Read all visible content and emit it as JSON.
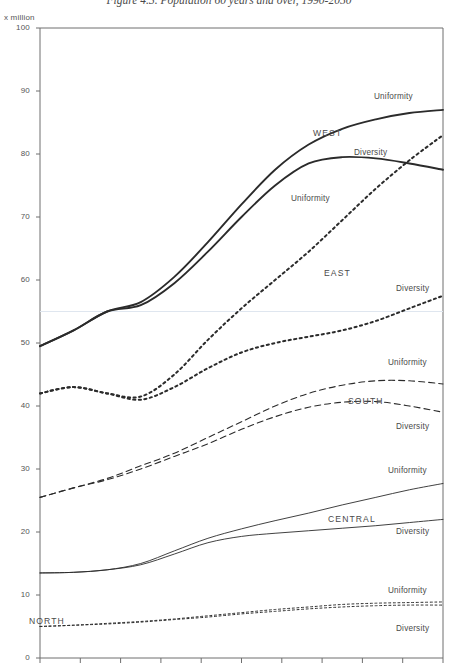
{
  "figure": {
    "title": "Figure 4.3.  Population 60 years and over, 1990-2050",
    "unit_label": "x million"
  },
  "axis": {
    "y_ticks": [
      "100",
      "90",
      "80",
      "70",
      "60",
      "50",
      "40",
      "30",
      "20",
      "10",
      "0"
    ],
    "y_min": 0,
    "y_max": 100,
    "x_min": 1990,
    "x_max": 2050,
    "x_tick_years": [
      1990,
      1996,
      2002,
      2008,
      2014,
      2020,
      2026,
      2032,
      2038,
      2044,
      2050
    ],
    "highlight_gridline_value": 55
  },
  "labels": {
    "region_west": "WEST",
    "region_east": "EAST",
    "region_south": "SOUTH",
    "region_central": "CENTRAL",
    "region_north": "NORTH",
    "west_uniformity": "Uniformity",
    "west_diversity": "Diversity",
    "east_uniformity": "Uniformity",
    "east_diversity": "Diversity",
    "south_uniformity": "Uniformity",
    "south_diversity": "Diversity",
    "central_uniformity": "Uniformity",
    "central_diversity": "Diversity",
    "north_uniformity": "Uniformity",
    "north_diversity": "Diversity"
  },
  "chart_data": {
    "type": "line",
    "title": "Figure 4.3.  Population 60 years and over, 1990-2050",
    "xlabel": "",
    "ylabel": "x million",
    "xlim": [
      1990,
      2050
    ],
    "ylim": [
      0,
      100
    ],
    "grid": false,
    "legend": "inline-annotations",
    "x": [
      1990,
      1995,
      2000,
      2005,
      2010,
      2015,
      2020,
      2025,
      2030,
      2035,
      2040,
      2045,
      2050
    ],
    "series": [
      {
        "name": "WEST Uniformity",
        "region": "WEST",
        "scenario": "Uniformity",
        "style": "solid-thick",
        "values": [
          49.5,
          52.0,
          55.0,
          56.5,
          60.5,
          66.0,
          72.0,
          77.5,
          81.5,
          84.0,
          85.5,
          86.5,
          87.0
        ]
      },
      {
        "name": "WEST Diversity",
        "region": "WEST",
        "scenario": "Diversity",
        "style": "solid-thick",
        "values": [
          49.5,
          52.0,
          55.0,
          56.0,
          59.5,
          64.5,
          70.0,
          75.0,
          78.5,
          79.5,
          79.3,
          78.5,
          77.5
        ]
      },
      {
        "name": "EAST Uniformity",
        "region": "EAST",
        "scenario": "Uniformity",
        "style": "dotted",
        "values": [
          42.0,
          43.0,
          42.0,
          41.5,
          45.0,
          50.5,
          55.5,
          60.0,
          64.5,
          69.5,
          74.5,
          79.0,
          83.0
        ]
      },
      {
        "name": "EAST Diversity",
        "region": "EAST",
        "scenario": "Diversity",
        "style": "dotted",
        "values": [
          42.0,
          43.0,
          42.0,
          41.0,
          43.0,
          46.0,
          48.5,
          50.0,
          51.0,
          52.0,
          53.5,
          55.5,
          57.5
        ]
      },
      {
        "name": "SOUTH Uniformity",
        "region": "SOUTH",
        "scenario": "Uniformity",
        "style": "dashed",
        "values": [
          25.5,
          27.0,
          28.5,
          30.5,
          32.5,
          35.0,
          37.5,
          40.0,
          42.0,
          43.3,
          44.0,
          44.0,
          43.5
        ]
      },
      {
        "name": "SOUTH Diversity",
        "region": "SOUTH",
        "scenario": "Diversity",
        "style": "dashed",
        "values": [
          25.5,
          27.0,
          28.3,
          30.0,
          32.0,
          34.0,
          36.3,
          38.3,
          39.8,
          40.6,
          40.7,
          40.0,
          39.0
        ]
      },
      {
        "name": "CENTRAL Uniformity",
        "region": "CENTRAL",
        "scenario": "Uniformity",
        "style": "solid-thin",
        "values": [
          13.5,
          13.6,
          14.0,
          15.0,
          17.0,
          19.0,
          20.5,
          21.8,
          23.0,
          24.3,
          25.5,
          26.7,
          27.7
        ]
      },
      {
        "name": "CENTRAL Diversity",
        "region": "CENTRAL",
        "scenario": "Diversity",
        "style": "solid-thin",
        "values": [
          13.5,
          13.6,
          14.0,
          14.8,
          16.5,
          18.3,
          19.3,
          19.8,
          20.2,
          20.6,
          21.0,
          21.5,
          22.0
        ]
      },
      {
        "name": "NORTH Uniformity",
        "region": "NORTH",
        "scenario": "Uniformity",
        "style": "fine-dotted",
        "values": [
          5.0,
          5.2,
          5.5,
          5.8,
          6.2,
          6.7,
          7.2,
          7.7,
          8.1,
          8.5,
          8.7,
          8.8,
          8.9
        ]
      },
      {
        "name": "NORTH Diversity",
        "region": "NORTH",
        "scenario": "Diversity",
        "style": "fine-dotted",
        "values": [
          5.0,
          5.2,
          5.4,
          5.7,
          6.1,
          6.5,
          7.0,
          7.4,
          7.8,
          8.1,
          8.3,
          8.4,
          8.4
        ]
      }
    ]
  }
}
